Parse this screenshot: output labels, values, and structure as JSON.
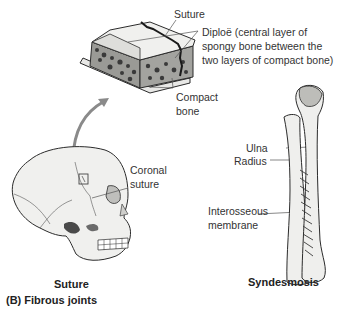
{
  "figure": {
    "section_title": "(B) Fibrous joints",
    "panels": [
      {
        "name": "suture",
        "caption": "Suture",
        "labels": {
          "suture": "Suture",
          "diploe_line1": "Diploë (central layer of",
          "diploe_line2": "spongy bone between the",
          "diploe_line3": "two layers of compact bone)",
          "compact_line1": "Compact",
          "compact_line2": "bone",
          "coronal_line1": "Coronal",
          "coronal_line2": "suture"
        }
      },
      {
        "name": "syndesmosis",
        "caption": "Syndesmosis",
        "labels": {
          "ulna": "Ulna",
          "radius": "Radius",
          "interosseous_line1": "Interosseous",
          "interosseous_line2": "membrane"
        }
      }
    ]
  },
  "colors": {
    "bone_fill": "#eeeeec",
    "bone_shade": "#c9c9c6",
    "outline": "#2b2b2b",
    "arrow": "#8a8a8a",
    "leader": "#555555"
  }
}
